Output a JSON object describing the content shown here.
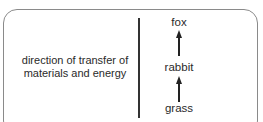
{
  "diagram": {
    "label": "direction of transfer of materials and energy",
    "label_lines": [
      "direction of transfer of",
      "materials and energy"
    ],
    "chain": [
      "grass",
      "rabbit",
      "fox"
    ],
    "nodes": {
      "top": "fox",
      "middle": "rabbit",
      "bottom": "grass"
    }
  }
}
